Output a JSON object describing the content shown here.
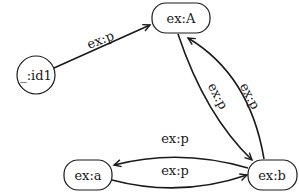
{
  "diagram": {
    "type": "rdf-graph",
    "nodes": [
      {
        "id": "id1",
        "label": "_:id1",
        "shape": "circle"
      },
      {
        "id": "A",
        "label": "ex:A",
        "shape": "rounded-rect"
      },
      {
        "id": "a",
        "label": "ex:a",
        "shape": "rounded-rect"
      },
      {
        "id": "b",
        "label": "ex:b",
        "shape": "rounded-rect"
      }
    ],
    "edges": [
      {
        "from": "id1",
        "to": "A",
        "label": "ex:p"
      },
      {
        "from": "A",
        "to": "b",
        "label": "ex:p"
      },
      {
        "from": "b",
        "to": "A",
        "label": "ex:p"
      },
      {
        "from": "b",
        "to": "a",
        "label": "ex:p"
      },
      {
        "from": "a",
        "to": "b",
        "label": "ex:p"
      }
    ],
    "colors": {
      "stroke": "#1a1a1a",
      "background": "#ffffff"
    }
  }
}
